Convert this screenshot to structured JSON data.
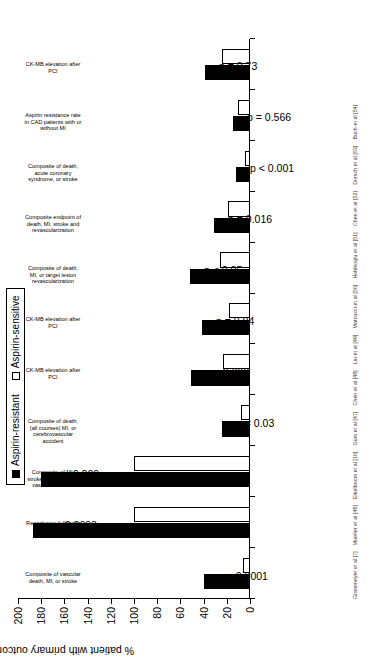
{
  "chart_data": {
    "type": "bar",
    "title": "",
    "subtitle": "",
    "xlabel": "",
    "ylabel": "% patient with primary outcome or odds ratio for primary outcome",
    "ylim": [
      0,
      200
    ],
    "yticks": [
      0,
      20,
      40,
      60,
      80,
      100,
      120,
      140,
      160,
      180,
      200
    ],
    "grid": false,
    "legend_position": "top",
    "categories": [
      "Composite of vascular death, MI, or stroke",
      "Reocclusion following peripheral PTA",
      "Composite of MI, stroke, or death from vascular disease",
      "Composite of death, (all courses) MI, or cerebrovascular accident",
      "CK-MB elevation after PCI",
      "CK-MB elevation after PCI",
      "Composite of death, MI, or target lesion revascularization",
      "Composite endpoint of death, MI, stroke and revascularization",
      "Composite of death, acute coronary syndrome, or stroke",
      "Aspirin resistance rate in CAD patients with or without MI",
      "CK-MB elevation after PCI"
    ],
    "series": [
      {
        "name": "Aspirin-resistant",
        "color": "#000000",
        "values": [
          40,
          187,
          180,
          24,
          51,
          41,
          52,
          31,
          12,
          15,
          39
        ]
      },
      {
        "name": "Aspirin-sensitive",
        "color": "#ffffff",
        "values": [
          6,
          100,
          100,
          8,
          23,
          18,
          26,
          19,
          4,
          10,
          24
        ]
      }
    ],
    "annotations": [
      "p < 0.0001",
      "p = 0.0093",
      "p = 0.009",
      "p = 0.03",
      "p = 0.006",
      "p = 0.04",
      "p < 0.05",
      "p = 0.016",
      "p < 0.001",
      "p = 0.566",
      "p = 0.73"
    ]
  },
  "legend": {
    "items": [
      {
        "label": "Aspirin-resistant",
        "style": "black"
      },
      {
        "label": "Aspirin-sensitive",
        "style": "white"
      }
    ]
  },
  "footnote": {
    "citations": [
      "Gratemeyer et al [7]",
      "Mueller et al [46]",
      "Eikelboom et al [10]",
      "Gum et al [47]",
      "Chen et al [48]",
      "Liu et al [49]",
      "Marcucci et al [50]",
      "Hobikoglu et al [51]",
      "Chen et al [52]",
      "Dorsch et al [53]",
      "Buch et al [54]"
    ]
  }
}
